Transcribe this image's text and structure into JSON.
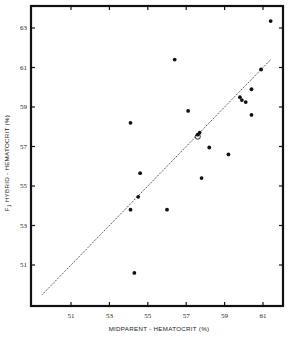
{
  "chart_data": {
    "type": "scatter",
    "title": "",
    "xlabel": "MIDPARENT - HEMATOCRIT (%)",
    "ylabel": "F1 HYBRID - HEMATOCRIT (%)",
    "ylabel_subscript": "1",
    "ylabel_prefix": "F",
    "ylabel_rest": " HYBRID - HEMATOCRIT (%)",
    "xlim": [
      49.0,
      62.1
    ],
    "ylim": [
      48.9,
      64.0
    ],
    "x_ticks": [
      51,
      53,
      55,
      57,
      59,
      61
    ],
    "y_ticks": [
      51,
      53,
      55,
      57,
      59,
      61,
      63
    ],
    "grid": false,
    "legend": null,
    "reference_line": {
      "style": "dotted",
      "label": "y = x",
      "x": [
        49.5,
        61.4
      ],
      "y": [
        49.5,
        61.4
      ]
    },
    "series": [
      {
        "name": "F1 hybrids",
        "marker": "filled-circle",
        "points": [
          {
            "x": 61.4,
            "y": 63.35
          },
          {
            "x": 60.9,
            "y": 60.9
          },
          {
            "x": 60.4,
            "y": 59.9
          },
          {
            "x": 59.8,
            "y": 59.5
          },
          {
            "x": 59.9,
            "y": 59.35
          },
          {
            "x": 60.1,
            "y": 59.25
          },
          {
            "x": 60.4,
            "y": 58.6
          },
          {
            "x": 59.2,
            "y": 56.6
          },
          {
            "x": 58.2,
            "y": 56.95
          },
          {
            "x": 57.8,
            "y": 55.4
          },
          {
            "x": 57.1,
            "y": 58.8
          },
          {
            "x": 56.4,
            "y": 61.4
          },
          {
            "x": 57.6,
            "y": 57.6
          },
          {
            "x": 57.7,
            "y": 57.7
          },
          {
            "x": 54.1,
            "y": 58.2
          },
          {
            "x": 54.6,
            "y": 55.65
          },
          {
            "x": 54.5,
            "y": 54.45
          },
          {
            "x": 54.1,
            "y": 53.8
          },
          {
            "x": 56.0,
            "y": 53.8
          },
          {
            "x": 54.3,
            "y": 50.6
          }
        ]
      },
      {
        "name": "open marker",
        "marker": "open-circle",
        "points": [
          {
            "x": 57.6,
            "y": 57.5
          }
        ]
      }
    ]
  },
  "layout": {
    "plot_left_px": 31,
    "plot_right_px": 283,
    "plot_top_px": 6,
    "plot_bottom_px": 306,
    "x_px_at_51": 71,
    "x_px_per_unit": 19.2,
    "y_px_at_51": 265,
    "y_px_per_unit": 19.75
  }
}
